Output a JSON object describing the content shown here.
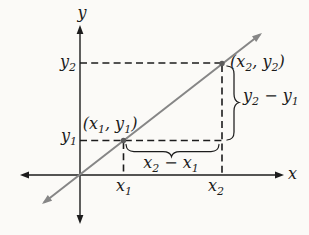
{
  "colors": {
    "background": "#fbfaf7",
    "axis": "#1c1c1c",
    "text": "#1c1c1c",
    "guide": "#1c1c1c",
    "line": "#868686",
    "point": "#5c5c5c",
    "brace": "#1c1c1c"
  },
  "axis_labels": {
    "x": "x",
    "y": "y"
  },
  "tick_labels": {
    "y2": [
      [
        "y"
      ],
      [
        "2",
        "sub"
      ]
    ],
    "y1": [
      [
        "y"
      ],
      [
        "1",
        "sub"
      ]
    ],
    "x1": [
      [
        "x"
      ],
      [
        "1",
        "sub"
      ]
    ],
    "x2": [
      [
        "x"
      ],
      [
        "2",
        "sub"
      ]
    ]
  },
  "point_labels": {
    "p1": [
      [
        "("
      ],
      [
        "x"
      ],
      [
        "1",
        "sub"
      ],
      [
        ", "
      ],
      [
        "y"
      ],
      [
        "1",
        "sub"
      ],
      [
        ")"
      ]
    ],
    "p2": [
      [
        "("
      ],
      [
        "x"
      ],
      [
        "2",
        "sub"
      ],
      [
        ", "
      ],
      [
        "y"
      ],
      [
        "2",
        "sub"
      ],
      [
        ")"
      ]
    ]
  },
  "measure_labels": {
    "run": [
      [
        "x"
      ],
      [
        "2",
        "sub"
      ],
      [
        " − "
      ],
      [
        "x"
      ],
      [
        "1",
        "sub"
      ]
    ],
    "rise": [
      [
        "y"
      ],
      [
        "2",
        "sub"
      ],
      [
        " − "
      ],
      [
        "y"
      ],
      [
        "1",
        "sub"
      ]
    ]
  }
}
